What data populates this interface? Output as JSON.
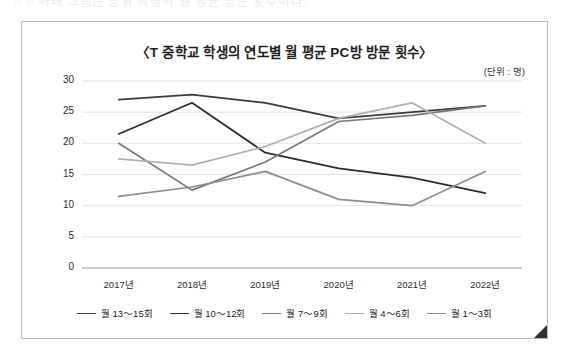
{
  "page": {
    "top_cut_text": "○  ○  아래  그림은  상위  학생의  월  평균  방문  횟수이다."
  },
  "chart_data": {
    "type": "line",
    "title": "〈T 중학교 학생의 연도별 월 평균 PC방 방문 횟수〉",
    "unit_label": "(단위 : 명)",
    "xlabel": "",
    "ylabel": "",
    "categories": [
      "2017년",
      "2018년",
      "2019년",
      "2020년",
      "2021년",
      "2022년"
    ],
    "ylim": [
      0,
      30
    ],
    "ytick_values": [
      0,
      5,
      10,
      15,
      20,
      25,
      30
    ],
    "ytick_labels": [
      "0",
      "5",
      "10",
      "15",
      "20",
      "25",
      "30"
    ],
    "grid": true,
    "legend_position": "bottom",
    "series": [
      {
        "name": "월 13～15회",
        "color": "#3b3b3b",
        "values": [
          27.0,
          27.8,
          26.5,
          24.0,
          25.0,
          26.0
        ]
      },
      {
        "name": "월 10～12회",
        "color": "#2b2b2b",
        "values": [
          21.5,
          26.5,
          18.5,
          16.0,
          14.5,
          12.0
        ]
      },
      {
        "name": "월 7～9회",
        "color": "#777777",
        "values": [
          20.0,
          12.5,
          17.0,
          23.5,
          24.5,
          26.0
        ]
      },
      {
        "name": "월 4～6회",
        "color": "#b0b0b0",
        "values": [
          17.5,
          16.5,
          19.5,
          24.0,
          26.5,
          20.0
        ]
      },
      {
        "name": "월 1～3회",
        "color": "#8c8c8c",
        "values": [
          11.5,
          13.0,
          15.5,
          11.0,
          10.0,
          15.5
        ]
      }
    ]
  }
}
